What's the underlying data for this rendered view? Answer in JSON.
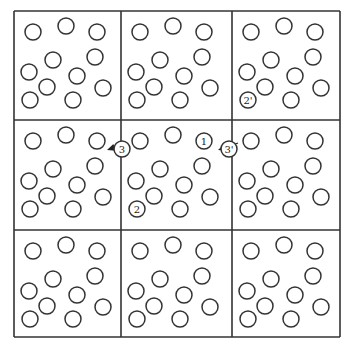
{
  "diagram": {
    "type": "periodic-boundary-conditions",
    "grid": {
      "rows": 3,
      "cols": 3,
      "x_lines": [
        14,
        121,
        232,
        340
      ],
      "y_lines": [
        11,
        120,
        230,
        337
      ],
      "stroke": "#333333"
    },
    "particle_radius": 8,
    "particle_stroke": "#333333",
    "particles_local": [
      [
        19,
        21
      ],
      [
        52,
        15
      ],
      [
        83,
        21
      ],
      [
        39,
        49
      ],
      [
        81,
        46
      ],
      [
        15,
        61
      ],
      [
        63,
        65
      ],
      [
        33,
        76
      ],
      [
        89,
        77
      ],
      [
        16,
        89
      ],
      [
        59,
        89
      ]
    ],
    "labels": {
      "particle_1": "1",
      "particle_2": "2",
      "particle_3": "3",
      "particle_2_image": "2'",
      "particle_3_image": "3'"
    },
    "labeled_particles": [
      {
        "id": "particle_1",
        "cell": [
          1,
          1
        ],
        "local": [
          83,
          21
        ]
      },
      {
        "id": "particle_2",
        "cell": [
          1,
          1
        ],
        "local": [
          16,
          89
        ]
      },
      {
        "id": "particle_2_image",
        "cell": [
          0,
          2
        ],
        "local": [
          16,
          89
        ]
      },
      {
        "id": "particle_3",
        "cell": [
          1,
          0
        ],
        "local": [
          108,
          29
        ]
      },
      {
        "id": "particle_3_image",
        "cell": [
          1,
          1
        ],
        "local": [
          108,
          29
        ]
      }
    ],
    "arrows": [
      {
        "from": [
          127,
          143
        ],
        "to": [
          107,
          150
        ]
      },
      {
        "from": [
          238,
          143
        ],
        "to": [
          218,
          150
        ]
      }
    ]
  }
}
